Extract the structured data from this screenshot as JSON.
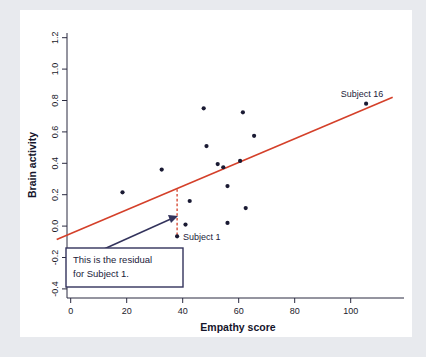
{
  "chart_data": {
    "type": "scatter",
    "title": "",
    "xlabel": "Empathy score",
    "ylabel": "Brain activity",
    "xlim": [
      -5,
      115
    ],
    "ylim": [
      -0.5,
      1.3
    ],
    "xticks": [
      0,
      20,
      40,
      60,
      80,
      100
    ],
    "xtick_labels": [
      "0",
      "20",
      "40",
      "60",
      "80",
      "100"
    ],
    "yticks": [
      -0.4,
      -0.2,
      0.0,
      0.2,
      0.4,
      0.6,
      0.8,
      1.0,
      1.2
    ],
    "ytick_labels": [
      "-0.4",
      "-0.2",
      "0.0",
      "0.2",
      "0.4",
      "0.6",
      "0.8",
      "1.0",
      "1.2"
    ],
    "grid": false,
    "legend": "none",
    "points": [
      {
        "x": 18.5,
        "y": 0.215,
        "label": ""
      },
      {
        "x": 32.5,
        "y": 0.36,
        "label": ""
      },
      {
        "x": 38.0,
        "y": -0.065,
        "label": "Subject 1"
      },
      {
        "x": 41.0,
        "y": 0.01,
        "label": ""
      },
      {
        "x": 42.5,
        "y": 0.16,
        "label": ""
      },
      {
        "x": 47.5,
        "y": 0.75,
        "label": ""
      },
      {
        "x": 48.5,
        "y": 0.51,
        "label": ""
      },
      {
        "x": 52.5,
        "y": 0.395,
        "label": ""
      },
      {
        "x": 54.5,
        "y": 0.375,
        "label": ""
      },
      {
        "x": 56.0,
        "y": 0.255,
        "label": ""
      },
      {
        "x": 56.0,
        "y": 0.02,
        "label": ""
      },
      {
        "x": 60.5,
        "y": 0.415,
        "label": ""
      },
      {
        "x": 61.5,
        "y": 0.725,
        "label": ""
      },
      {
        "x": 62.5,
        "y": 0.115,
        "label": ""
      },
      {
        "x": 65.5,
        "y": 0.575,
        "label": ""
      },
      {
        "x": 105.5,
        "y": 0.78,
        "label": "Subject 16"
      }
    ],
    "regression_line": {
      "x_start": -5,
      "y_start": -0.085,
      "x_end": 115,
      "y_end": 0.82,
      "color": "#d4402a"
    },
    "residual": {
      "subject": "Subject 1",
      "x": 38.0,
      "y_observed": -0.065,
      "y_predicted": 0.235,
      "color": "#d4402a",
      "style": "dashed"
    },
    "point_labels": [
      {
        "text": "Subject 1",
        "x": 38.0,
        "y": -0.065
      },
      {
        "text": "Subject 16",
        "x": 105.5,
        "y": 0.78
      }
    ],
    "annotation": {
      "line1": "This is the residual",
      "line2": "for Subject 1.",
      "border_color": "#33335c"
    },
    "colors": {
      "point": "#1a1a33",
      "regression": "#d4402a",
      "annotation_border": "#33335c",
      "axis": "#2b2b40",
      "plot_background": "#ffffff",
      "figure_background": "#e8eaee"
    }
  }
}
